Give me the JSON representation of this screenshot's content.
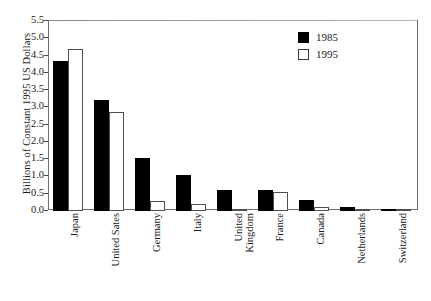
{
  "chart_data": {
    "type": "bar",
    "title": "",
    "subtitle": "",
    "xlabel": "",
    "ylabel": "Billions of Constant 1995 US Dollars",
    "categories": [
      "Japan",
      "United Sates",
      "Germany",
      "Italy",
      "United Kingdom",
      "France",
      "Canada",
      "Netherlands",
      "Switzerland"
    ],
    "category_lines": [
      [
        "Japan"
      ],
      [
        "United Sates"
      ],
      [
        "Germany"
      ],
      [
        "Italy"
      ],
      [
        "United",
        "Kingdom"
      ],
      [
        "France"
      ],
      [
        "Canada"
      ],
      [
        "Netherlands"
      ],
      [
        "Switzerland"
      ]
    ],
    "series": [
      {
        "name": "1985",
        "color": "#000000",
        "values": [
          4.35,
          3.2,
          1.53,
          1.05,
          0.62,
          0.6,
          0.32,
          0.13,
          0.02
        ]
      },
      {
        "name": "1995",
        "color": "#ffffff",
        "values": [
          4.7,
          2.88,
          0.29,
          0.21,
          0.04,
          0.54,
          0.11,
          0.04,
          0.03
        ]
      }
    ],
    "ylim": [
      0.0,
      5.5
    ],
    "ytick_step": 0.5,
    "ytick_labels": [
      "5.5",
      "5.0",
      "4.5",
      "4.0",
      "3.5",
      "3.0",
      "2.5",
      "2.0",
      "1.5",
      "1.0",
      "0.5",
      "0.0"
    ],
    "grid": false,
    "legend_position": "top-right",
    "legend_entries": [
      "1985",
      "1995"
    ]
  }
}
